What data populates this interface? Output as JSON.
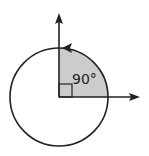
{
  "diagram": {
    "title": "",
    "angle_label": "90°",
    "angle_degrees": 90,
    "colors": {
      "stroke": "#222222",
      "sector_fill": "#cccccc",
      "background": "#ffffff"
    },
    "geometry": {
      "center": [
        59,
        97
      ],
      "radius": 49,
      "x_axis_end": [
        139,
        97
      ],
      "y_axis_end": [
        59,
        14
      ],
      "right_angle_marker_size": 13
    },
    "elements": [
      "circle",
      "shaded-quarter-sector",
      "x-axis-arrow",
      "y-axis-arrow",
      "arc-direction-arrow",
      "right-angle-marker",
      "angle-label"
    ]
  }
}
